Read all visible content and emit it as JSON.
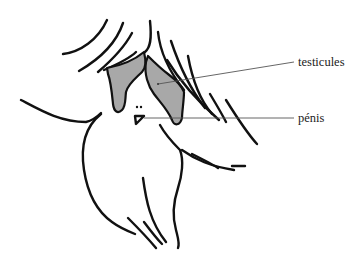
{
  "diagram": {
    "type": "anatomical-illustration",
    "labels": [
      {
        "id": "testicules",
        "text": "testicules"
      },
      {
        "id": "penis",
        "text": "pénis"
      }
    ],
    "colors": {
      "outline": "#111111",
      "fill_highlight": "#a8a8a8",
      "leader_line": "#555555",
      "label_text": "#222222",
      "background": "#ffffff"
    }
  }
}
